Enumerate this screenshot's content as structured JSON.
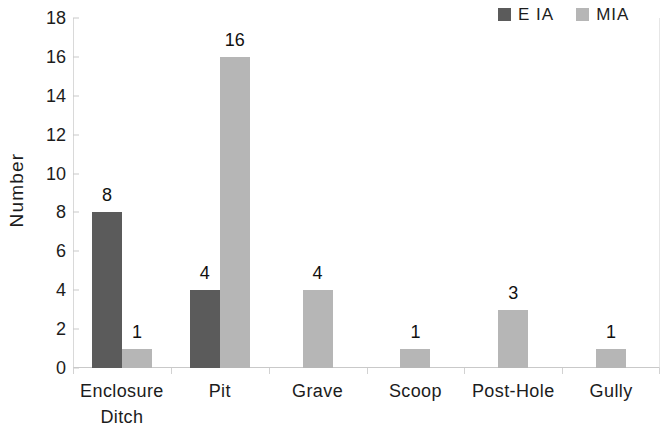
{
  "chart_data": {
    "type": "bar",
    "title": "",
    "xlabel": "",
    "ylabel": "Number",
    "ylim": [
      0,
      18
    ],
    "ytick_step": 2,
    "yticks": [
      "18",
      "16",
      "14",
      "12",
      "10",
      "8",
      "6",
      "4",
      "2",
      "0"
    ],
    "grid": false,
    "legend_position": "top-right",
    "categories": [
      "Enclosure\nDitch",
      "Pit",
      "Grave",
      "Scoop",
      "Post-Hole",
      "Gully"
    ],
    "series": [
      {
        "name": "E IA",
        "color": "#5b5b5b",
        "values": [
          8,
          4,
          null,
          null,
          null,
          null
        ],
        "labels": [
          "8",
          "4",
          "",
          "",
          "",
          ""
        ]
      },
      {
        "name": "MIA",
        "color": "#b6b6b6",
        "values": [
          1,
          16,
          4,
          1,
          3,
          1
        ],
        "labels": [
          "1",
          "16",
          "4",
          "1",
          "3",
          "1"
        ]
      }
    ]
  },
  "legend": {
    "items": [
      {
        "label": "E IA",
        "swatch_color": "#5b5b5b",
        "icon": "legend-swatch-icon"
      },
      {
        "label": "MIA",
        "swatch_color": "#b6b6b6",
        "icon": "legend-swatch-icon"
      }
    ]
  },
  "axes": {
    "y_title": "Number"
  }
}
